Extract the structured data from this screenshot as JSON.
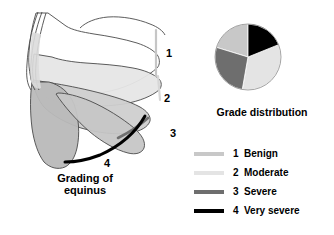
{
  "figure": {
    "background": "#ffffff",
    "width": 334,
    "height": 235
  },
  "left_panel": {
    "name": "grading-of-equinus-diagram",
    "caption_line1": "Grading of",
    "caption_line2": "equinus",
    "callouts": [
      {
        "label": "1",
        "x": 166,
        "y": 50
      },
      {
        "label": "2",
        "x": 164,
        "y": 93
      },
      {
        "label": "3",
        "x": 170,
        "y": 128
      },
      {
        "label": "4",
        "x": 103,
        "y": 158
      }
    ],
    "shading": {
      "grade1_fill": "#ffffff",
      "grade2_fill": "#e2e2e2",
      "grade3_fill": "#c0c0c0",
      "grade4_fill": "#a8a8a8",
      "outline": "#4a4a4a",
      "marker1_line": "#c8c8c8",
      "marker2_line": "#d8d8d8",
      "marker3_line": "#707070",
      "marker4_line": "#000000"
    }
  },
  "pie": {
    "title": "Grade distribution",
    "center": {
      "x": 35,
      "y": 35
    },
    "radius": 33
  },
  "legend": {
    "items": [
      {
        "num": "1",
        "label": "Benign",
        "color": "#c8c8c8"
      },
      {
        "num": "2",
        "label": "Moderate",
        "color": "#e4e4e4"
      },
      {
        "num": "3",
        "label": "Severe",
        "color": "#6e6e6e"
      },
      {
        "num": "4",
        "label": "Very severe",
        "color": "#000000"
      }
    ]
  },
  "chart_data": {
    "type": "pie",
    "title": "Grade distribution",
    "categories": [
      "1 Benign",
      "2 Moderate",
      "3 Severe",
      "4 Very severe"
    ],
    "values": [
      20,
      34,
      27,
      19
    ],
    "unit": "percent",
    "colors": [
      "#c8c8c8",
      "#e4e4e4",
      "#6e6e6e",
      "#000000"
    ],
    "start_angle_deg": 0,
    "direction": "clockwise",
    "slice_start_angles_deg": [
      287,
      68,
      190,
      0
    ],
    "slice_end_angles_deg": [
      360,
      190,
      287,
      68
    ],
    "legend_position": "below",
    "grid": false,
    "xlabel": "",
    "ylabel": ""
  }
}
